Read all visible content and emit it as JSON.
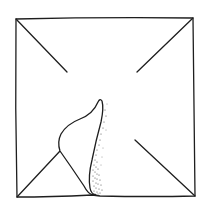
{
  "illustration": {
    "subject": "square paper with crease lines toward center and a folded, curled flap at bottom",
    "colors": {
      "background": "#ffffff",
      "ink": "#1e1e1e",
      "shading": "#333333"
    },
    "square": {
      "top_left": [
        16,
        19
      ],
      "top_right": [
        193,
        18
      ],
      "bottom_right": [
        195,
        196
      ],
      "bottom_left": [
        17,
        197
      ]
    },
    "creases": [
      {
        "name": "top-left",
        "from": [
          16,
          19
        ],
        "to": [
          67,
          72
        ]
      },
      {
        "name": "top-right",
        "from": [
          193,
          18
        ],
        "to": [
          137,
          72
        ]
      },
      {
        "name": "bottom-right",
        "from": [
          195,
          196
        ],
        "to": [
          135,
          140
        ]
      },
      {
        "name": "bottom-left",
        "from": [
          17,
          197
        ],
        "to": [
          60,
          151
        ]
      }
    ]
  }
}
